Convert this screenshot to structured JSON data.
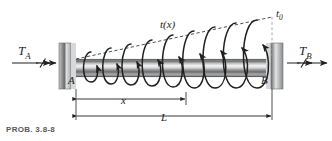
{
  "figure": {
    "caption": "PROB. 3.8-8",
    "labels": {
      "torque_left": "T",
      "torque_left_sub": "A",
      "torque_right": "T",
      "torque_right_sub": "B",
      "end_left": "A",
      "end_right": "B",
      "distributed_torque": "t(x)",
      "peak_intensity": "t",
      "peak_intensity_sub": "0",
      "dim_x": "x",
      "dim_L": "L"
    },
    "colors": {
      "line": "#231f20",
      "caption": "#58585a",
      "support_dark": "#6d6e70",
      "support_light": "#d9d9d9",
      "shaft_dark": "#808285",
      "shaft_light": "#f2f2f2",
      "background": "#ffffff"
    },
    "geometry": {
      "shaft_left_x": 76,
      "shaft_right_x": 266,
      "shaft_top_y": 59,
      "shaft_bottom_y": 77,
      "dim_x_value_end": 186,
      "arrow_count": 9
    }
  }
}
